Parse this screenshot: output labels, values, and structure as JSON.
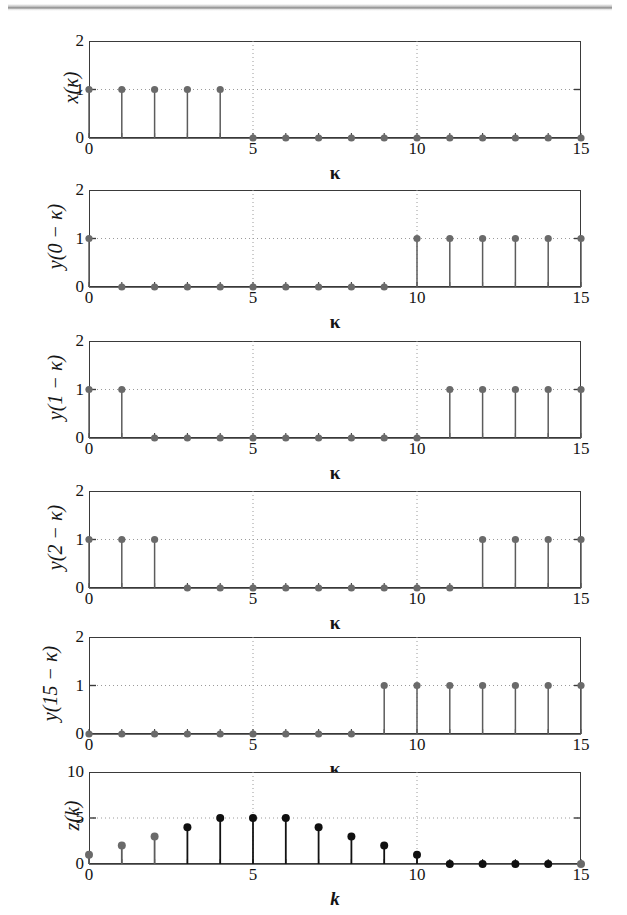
{
  "figure": {
    "title": "",
    "panel_count": 6,
    "colors": {
      "axis": "#3a3a3a",
      "grid": "#9a9a9a",
      "stem_dark": "#121212",
      "stem_gray": "#5c5c5c",
      "marker_dark": "#101010",
      "marker_gray": "#6a6a6a",
      "background": "#ffffff"
    },
    "scan_artifact": "top-edge-gray-band"
  },
  "chart_data": [
    {
      "type": "stem",
      "name": "panel-1",
      "ylabel": "x(κ)",
      "xlabel": "κ",
      "x": [
        0,
        1,
        2,
        3,
        4,
        5,
        6,
        7,
        8,
        9,
        10,
        11,
        12,
        13,
        14,
        15
      ],
      "values": [
        1,
        1,
        1,
        1,
        1,
        0,
        0,
        0,
        0,
        0,
        0,
        0,
        0,
        0,
        0,
        0
      ],
      "xlim": [
        0,
        15
      ],
      "ylim": [
        0,
        2
      ],
      "xticks": [
        0,
        5,
        10,
        15
      ],
      "yticks": [
        0,
        1,
        2
      ],
      "xticklabels": [
        "0",
        "5",
        "10",
        "15"
      ],
      "yticklabels": [
        "0",
        "1",
        "2"
      ],
      "grid": true
    },
    {
      "type": "stem",
      "name": "panel-2",
      "ylabel": "y(0 − κ)",
      "xlabel": "κ",
      "x": [
        0,
        1,
        2,
        3,
        4,
        5,
        6,
        7,
        8,
        9,
        10,
        11,
        12,
        13,
        14,
        15
      ],
      "values": [
        1,
        0,
        0,
        0,
        0,
        0,
        0,
        0,
        0,
        0,
        1,
        1,
        1,
        1,
        1,
        1
      ],
      "xlim": [
        0,
        15
      ],
      "ylim": [
        0,
        2
      ],
      "xticks": [
        0,
        5,
        10,
        15
      ],
      "yticks": [
        0,
        1,
        2
      ],
      "xticklabels": [
        "0",
        "5",
        "10",
        "15"
      ],
      "yticklabels": [
        "0",
        "1",
        "2"
      ],
      "grid": true
    },
    {
      "type": "stem",
      "name": "panel-3",
      "ylabel": "y(1 − κ)",
      "xlabel": "κ",
      "x": [
        0,
        1,
        2,
        3,
        4,
        5,
        6,
        7,
        8,
        9,
        10,
        11,
        12,
        13,
        14,
        15
      ],
      "values": [
        1,
        1,
        0,
        0,
        0,
        0,
        0,
        0,
        0,
        0,
        0,
        1,
        1,
        1,
        1,
        1
      ],
      "xlim": [
        0,
        15
      ],
      "ylim": [
        0,
        2
      ],
      "xticks": [
        0,
        5,
        10,
        15
      ],
      "yticks": [
        0,
        1,
        2
      ],
      "xticklabels": [
        "0",
        "5",
        "10",
        "15"
      ],
      "yticklabels": [
        "0",
        "1",
        "2"
      ],
      "grid": true
    },
    {
      "type": "stem",
      "name": "panel-4",
      "ylabel": "y(2 − κ)",
      "xlabel": "κ",
      "x": [
        0,
        1,
        2,
        3,
        4,
        5,
        6,
        7,
        8,
        9,
        10,
        11,
        12,
        13,
        14,
        15
      ],
      "values": [
        1,
        1,
        1,
        0,
        0,
        0,
        0,
        0,
        0,
        0,
        0,
        0,
        1,
        1,
        1,
        1
      ],
      "xlim": [
        0,
        15
      ],
      "ylim": [
        0,
        2
      ],
      "xticks": [
        0,
        5,
        10,
        15
      ],
      "yticks": [
        0,
        1,
        2
      ],
      "xticklabels": [
        "0",
        "5",
        "10",
        "15"
      ],
      "yticklabels": [
        "0",
        "1",
        "2"
      ],
      "grid": true
    },
    {
      "type": "stem",
      "name": "panel-5",
      "ylabel": "y(15 − κ)",
      "xlabel": "κ",
      "x": [
        0,
        1,
        2,
        3,
        4,
        5,
        6,
        7,
        8,
        9,
        10,
        11,
        12,
        13,
        14,
        15
      ],
      "values": [
        0,
        0,
        0,
        0,
        0,
        0,
        0,
        0,
        0,
        1,
        1,
        1,
        1,
        1,
        1,
        1
      ],
      "xlim": [
        0,
        15
      ],
      "ylim": [
        0,
        2
      ],
      "xticks": [
        0,
        5,
        10,
        15
      ],
      "yticks": [
        0,
        1,
        2
      ],
      "xticklabels": [
        "0",
        "5",
        "10",
        "15"
      ],
      "yticklabels": [
        "0",
        "1",
        "2"
      ],
      "grid": true
    },
    {
      "type": "stem",
      "name": "panel-6",
      "ylabel": "z(k)",
      "xlabel": "k",
      "x": [
        0,
        1,
        2,
        3,
        4,
        5,
        6,
        7,
        8,
        9,
        10,
        11,
        12,
        13,
        14,
        15
      ],
      "values": [
        1,
        2,
        3,
        4,
        5,
        5,
        5,
        4,
        3,
        2,
        1,
        0,
        0,
        0,
        0,
        0
      ],
      "xlim": [
        0,
        15
      ],
      "ylim": [
        0,
        10
      ],
      "xticks": [
        0,
        5,
        10,
        15
      ],
      "yticks": [
        0,
        5,
        10
      ],
      "xticklabels": [
        "0",
        "5",
        "10",
        "15"
      ],
      "yticklabels": [
        "0",
        "5",
        "10"
      ],
      "grid": true
    }
  ]
}
